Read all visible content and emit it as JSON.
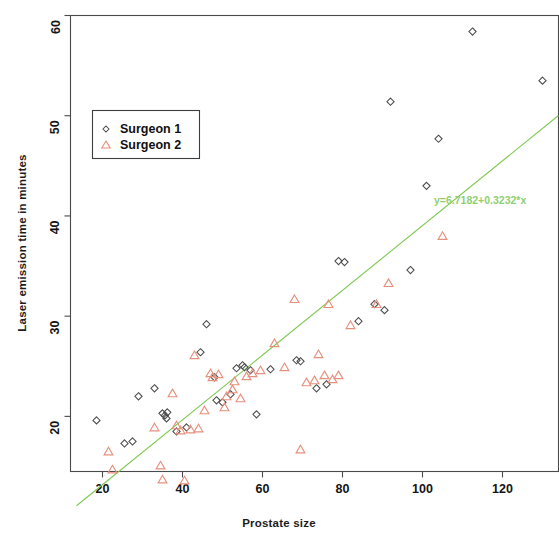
{
  "chart_data": {
    "type": "scatter",
    "title": "",
    "xlabel": "Prostate size",
    "ylabel": "Laser emission time in minutes",
    "xlim": [
      12,
      134
    ],
    "ylim": [
      14.5,
      60
    ],
    "xticks": [
      20,
      40,
      60,
      80,
      100,
      120
    ],
    "yticks": [
      20,
      30,
      40,
      50,
      60
    ],
    "grid": false,
    "legend_position": "upper left",
    "legend_entries": [
      "Surgeon 1",
      "Surgeon 2"
    ],
    "annotation": "y=6.7182+0.3232*x",
    "fit_line": {
      "intercept": 6.7182,
      "slope": 0.3232,
      "color": "#7ec850",
      "x_start": 13.5,
      "x_end": 134
    },
    "series": [
      {
        "name": "Surgeon 1",
        "marker": "circle",
        "color": "#4c4c4c",
        "points": [
          [
            18.5,
            19.6
          ],
          [
            25.5,
            17.3
          ],
          [
            27.5,
            17.5
          ],
          [
            29.0,
            22.0
          ],
          [
            33.0,
            22.8
          ],
          [
            35.0,
            20.3
          ],
          [
            35.6,
            20.1
          ],
          [
            36.2,
            20.4
          ],
          [
            36.0,
            19.8
          ],
          [
            38.5,
            18.5
          ],
          [
            41.0,
            18.9
          ],
          [
            44.5,
            26.4
          ],
          [
            46.0,
            29.2
          ],
          [
            48.0,
            23.9
          ],
          [
            48.5,
            21.6
          ],
          [
            50.0,
            21.4
          ],
          [
            52.0,
            22.2
          ],
          [
            53.5,
            24.8
          ],
          [
            55.0,
            25.1
          ],
          [
            55.5,
            24.9
          ],
          [
            57.0,
            24.6
          ],
          [
            58.5,
            20.2
          ],
          [
            62.0,
            24.7
          ],
          [
            68.5,
            25.6
          ],
          [
            69.5,
            25.5
          ],
          [
            73.5,
            22.8
          ],
          [
            76.0,
            23.2
          ],
          [
            79.0,
            35.5
          ],
          [
            80.5,
            35.4
          ],
          [
            84.0,
            29.5
          ],
          [
            88.0,
            31.2
          ],
          [
            90.5,
            30.6
          ],
          [
            92.0,
            51.4
          ],
          [
            97.0,
            34.6
          ],
          [
            101.0,
            43.0
          ],
          [
            104.0,
            47.7
          ],
          [
            112.5,
            58.4
          ],
          [
            130.0,
            53.5
          ]
        ]
      },
      {
        "name": "Surgeon 2",
        "marker": "triangle",
        "color": "#e8907e",
        "points": [
          [
            21.5,
            16.5
          ],
          [
            22.5,
            14.7
          ],
          [
            33.0,
            18.9
          ],
          [
            34.5,
            15.1
          ],
          [
            35.0,
            13.7
          ],
          [
            37.5,
            22.3
          ],
          [
            38.5,
            19.1
          ],
          [
            39.5,
            18.6
          ],
          [
            40.5,
            13.6
          ],
          [
            42.0,
            18.7
          ],
          [
            43.0,
            26.1
          ],
          [
            44.0,
            18.8
          ],
          [
            45.5,
            20.6
          ],
          [
            47.0,
            24.3
          ],
          [
            47.5,
            23.9
          ],
          [
            49.0,
            24.2
          ],
          [
            50.5,
            20.9
          ],
          [
            51.0,
            22.0
          ],
          [
            52.5,
            22.7
          ],
          [
            53.0,
            23.5
          ],
          [
            54.5,
            21.8
          ],
          [
            56.0,
            24.0
          ],
          [
            57.5,
            24.3
          ],
          [
            59.5,
            24.6
          ],
          [
            63.0,
            27.3
          ],
          [
            65.5,
            24.9
          ],
          [
            68.0,
            31.7
          ],
          [
            69.5,
            16.7
          ],
          [
            71.0,
            23.4
          ],
          [
            73.0,
            23.6
          ],
          [
            74.0,
            26.2
          ],
          [
            75.5,
            24.1
          ],
          [
            76.5,
            31.2
          ],
          [
            77.5,
            23.7
          ],
          [
            79.0,
            24.1
          ],
          [
            82.0,
            29.1
          ],
          [
            88.5,
            31.2
          ],
          [
            91.5,
            33.3
          ],
          [
            105.0,
            38.0
          ]
        ]
      }
    ]
  },
  "axes": {
    "x_title": "Prostate size",
    "y_title": "Laser emission time in minutes",
    "x_tick_labels": [
      "20",
      "40",
      "60",
      "80",
      "100",
      "120"
    ],
    "y_tick_labels": [
      "20",
      "30",
      "40",
      "50",
      "60"
    ]
  },
  "legend": {
    "item1": "Surgeon 1",
    "item2": "Surgeon 2"
  },
  "annotation": {
    "equation": "y=6.7182+0.3232*x"
  }
}
